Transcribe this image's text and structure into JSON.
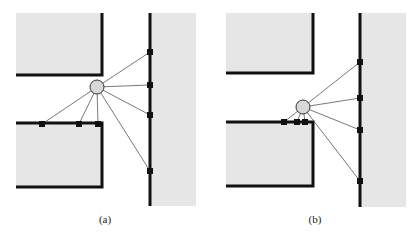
{
  "figure": {
    "colors": {
      "region_fill": "#e6e6e6",
      "wall": "#111111",
      "ray": "#555555",
      "node_fill": "#d8d8d8",
      "node_stroke": "#333333",
      "marker": "#111111"
    },
    "panels": [
      {
        "id": "a",
        "label": "(a)",
        "wall_markers": 4,
        "edge_markers": 3,
        "ray_count": 7
      },
      {
        "id": "b",
        "label": "(b)",
        "wall_markers": 4,
        "edge_markers": 3,
        "ray_count": 7
      }
    ]
  }
}
